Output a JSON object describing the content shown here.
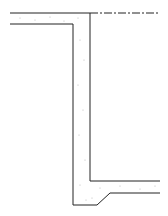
{
  "diagram": {
    "type": "section-detail",
    "colors": {
      "line": "#222222",
      "fill": "#ffffff",
      "stipple": "#999999"
    }
  }
}
